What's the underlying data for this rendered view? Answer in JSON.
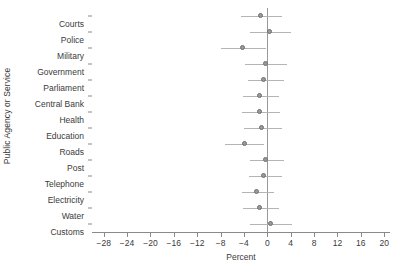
{
  "chart_data": {
    "type": "scatter",
    "title": "",
    "xlabel": "Percent",
    "ylabel": "Public Agency or Service",
    "grid": false,
    "legend": "none",
    "orientation": "horizontal",
    "marker": "circle-with-horizontal-error-bars",
    "xlim": [
      -30,
      21
    ],
    "xticks": [
      -28,
      -24,
      -20,
      -16,
      -12,
      -8,
      -4,
      0,
      4,
      8,
      12,
      16,
      20
    ],
    "xticklabels": [
      "-28",
      "-24",
      "-20",
      "-16",
      "-12",
      "-8",
      "-4",
      "0",
      "4",
      "8",
      "12",
      "16",
      "20"
    ],
    "zero_reference_line": 0,
    "categories": [
      "Courts",
      "Police",
      "Military",
      "Government",
      "Parliament",
      "Central Bank",
      "Health",
      "Education",
      "Roads",
      "Post",
      "Telephone",
      "Electricity",
      "Water",
      "Customs"
    ],
    "values": [
      -1.0,
      0.5,
      -4.0,
      -0.2,
      -0.4,
      -1.2,
      -1.2,
      -0.8,
      -3.8,
      -0.1,
      -0.4,
      -1.6,
      -1.1,
      0.7
    ],
    "ci_low": [
      -4.5,
      -3.0,
      -8.0,
      -3.8,
      -3.3,
      -4.2,
      -4.4,
      -4.0,
      -7.3,
      -3.0,
      -3.2,
      -4.3,
      -4.2,
      -2.9
    ],
    "ci_high": [
      2.6,
      4.0,
      -0.2,
      3.4,
      2.8,
      2.0,
      2.2,
      2.6,
      -0.6,
      2.8,
      2.5,
      1.2,
      2.0,
      4.2
    ],
    "colors": {
      "marker_fill": "#9a9a9a",
      "marker_edge": "#6e6e6e",
      "error_bar": "#b4b4b4",
      "axis": "#8a8a8a",
      "zero_line": "#999999",
      "text": "#3a3a3a",
      "background": "#ffffff"
    }
  }
}
